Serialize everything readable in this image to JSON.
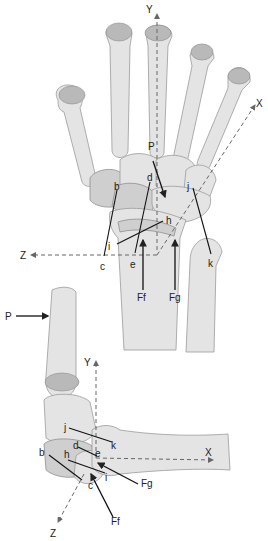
{
  "figure": {
    "top_view": {
      "name": "dorsal view of wrist",
      "axes": {
        "y": "Y",
        "x": "X",
        "z": "Z"
      },
      "force_labels": {
        "p": "P",
        "ff": "Ff",
        "fg": "Fg"
      },
      "point_labels": {
        "b": "b",
        "c": "c",
        "d": "d",
        "e": "e",
        "h": "h",
        "i": "i",
        "j": "j",
        "k": "k"
      }
    },
    "bottom_view": {
      "name": "lateral view of wrist",
      "axes": {
        "y": "Y",
        "x": "X",
        "z": "Z"
      },
      "force_labels": {
        "p": "P",
        "ff": "Ff",
        "fg": "Fg"
      },
      "point_labels": {
        "b": "b",
        "c": "c",
        "d": "d",
        "e": "e",
        "h": "h",
        "i": "i",
        "j": "j",
        "k": "k"
      }
    }
  },
  "colors": {
    "bone": "#e4e4e4",
    "bone_shadow": "#b9b9b9",
    "axis": "#666666",
    "label": "#222222"
  }
}
